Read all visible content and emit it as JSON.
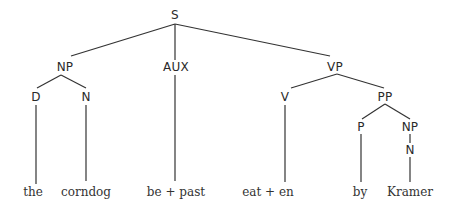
{
  "diagram": {
    "type": "syntax-tree",
    "colors": {
      "line": "#333333",
      "text": "#2a2a2a",
      "background": "#ffffff"
    },
    "nodes": {
      "s": {
        "label": "S",
        "x": 175,
        "y": 15
      },
      "np1": {
        "label": "NP",
        "x": 65,
        "y": 67
      },
      "aux": {
        "label": "AUX",
        "x": 176,
        "y": 67
      },
      "vp": {
        "label": "VP",
        "x": 335,
        "y": 67
      },
      "d": {
        "label": "D",
        "x": 36,
        "y": 97
      },
      "n1": {
        "label": "N",
        "x": 86,
        "y": 97
      },
      "v": {
        "label": "V",
        "x": 285,
        "y": 97
      },
      "pp": {
        "label": "PP",
        "x": 385,
        "y": 97
      },
      "p": {
        "label": "P",
        "x": 361,
        "y": 127
      },
      "np2": {
        "label": "NP",
        "x": 410,
        "y": 127
      },
      "n2": {
        "label": "N",
        "x": 410,
        "y": 150
      }
    },
    "leaves": {
      "the": {
        "label": "the",
        "x": 33,
        "y": 192
      },
      "corndog": {
        "label": "corndog",
        "x": 86,
        "y": 192
      },
      "be_past": {
        "label": "be + past",
        "x": 176,
        "y": 192
      },
      "eat_en": {
        "label": "eat  + en",
        "x": 268,
        "y": 192
      },
      "by": {
        "label": "by",
        "x": 360,
        "y": 192
      },
      "kramer": {
        "label": "Kramer",
        "x": 410,
        "y": 192
      }
    },
    "edges": [
      [
        175,
        24,
        71,
        56
      ],
      [
        175,
        24,
        175,
        60
      ],
      [
        175,
        24,
        330,
        56
      ],
      [
        61,
        75,
        37,
        88
      ],
      [
        61,
        75,
        86,
        88
      ],
      [
        175,
        75,
        175,
        181
      ],
      [
        337,
        74,
        291,
        88
      ],
      [
        337,
        74,
        384,
        88
      ],
      [
        36,
        105,
        36,
        184
      ],
      [
        86,
        105,
        86,
        181
      ],
      [
        285,
        105,
        285,
        182
      ],
      [
        385,
        104,
        362,
        119
      ],
      [
        385,
        104,
        410,
        119
      ],
      [
        361,
        134,
        361,
        182
      ],
      [
        410,
        134,
        410,
        143
      ],
      [
        410,
        157,
        410,
        182
      ]
    ]
  }
}
